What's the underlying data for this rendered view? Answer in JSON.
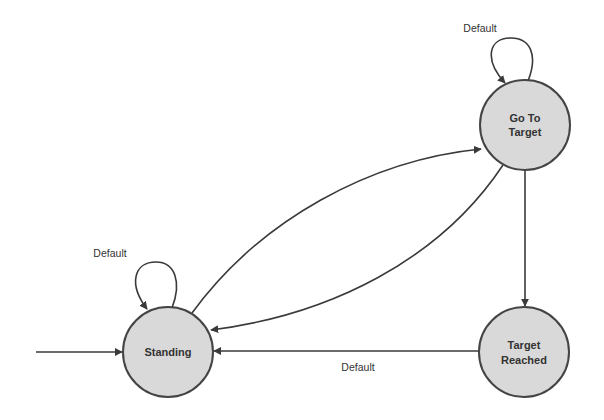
{
  "diagram": {
    "type": "state-machine",
    "states": [
      {
        "id": "standing",
        "label_lines": [
          "Standing"
        ],
        "cx": 168,
        "cy": 352,
        "r": 45
      },
      {
        "id": "go_to_target",
        "label_lines": [
          "Go To",
          "Target"
        ],
        "cx": 525,
        "cy": 125,
        "r": 45
      },
      {
        "id": "target_reached",
        "label_lines": [
          "Target",
          "Reached"
        ],
        "cx": 524,
        "cy": 352,
        "r": 45
      }
    ],
    "initial_state": "standing",
    "transitions": [
      {
        "from": "initial",
        "to": "standing",
        "label": ""
      },
      {
        "from": "standing",
        "to": "standing",
        "label": "Default"
      },
      {
        "from": "go_to_target",
        "to": "go_to_target",
        "label": "Default"
      },
      {
        "from": "standing",
        "to": "go_to_target",
        "label": ""
      },
      {
        "from": "go_to_target",
        "to": "standing",
        "label": ""
      },
      {
        "from": "go_to_target",
        "to": "target_reached",
        "label": ""
      },
      {
        "from": "target_reached",
        "to": "standing",
        "label": "Default"
      }
    ],
    "labels": {
      "standing": "Standing",
      "go_to_target_line1": "Go To",
      "go_to_target_line2": "Target",
      "target_reached_line1": "Target",
      "target_reached_line2": "Reached",
      "standing_self_loop": "Default",
      "go_to_target_self_loop": "Default",
      "reached_to_standing": "Default"
    },
    "colors": {
      "state_fill": "#d9d9d9",
      "state_stroke": "#444444",
      "edge": "#3a3a3a",
      "text": "#333333"
    }
  }
}
